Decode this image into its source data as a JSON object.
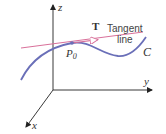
{
  "diagram": {
    "axes": {
      "z_label": "z",
      "y_label": "y",
      "x_label": "x"
    },
    "curve": {
      "label": "C",
      "color": "#6a6fb8"
    },
    "point": {
      "label_main": "P",
      "label_sub": "0"
    },
    "tangent": {
      "vector_label": "T",
      "line_label_1": "Tangent",
      "line_label_2": "line",
      "color": "#d9709a"
    },
    "axis_color": "#222222"
  }
}
